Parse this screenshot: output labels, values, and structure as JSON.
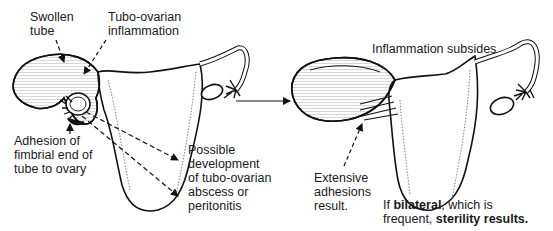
{
  "diagram": {
    "type": "medical-illustration",
    "left_panel": {
      "labels": {
        "swollen_tube": "Swollen\ntube",
        "tubo_ovarian_inflammation": "Tubo-ovarian\ninflammation",
        "adhesion": "Adhesion of\nfimbrial end of\ntube to ovary",
        "possible_development": "Possible\ndevelopment\nof tubo-ovarian\nabscess or\nperitonitis"
      }
    },
    "transition_arrow": "progression-arrow",
    "right_panel": {
      "labels": {
        "inflammation_subsides": "Inflammation subsides",
        "extensive_adhesions": "Extensive\nadhesions\nresult.",
        "bilateral_prefix": "If ",
        "bilateral_bold": "bilateral",
        "bilateral_mid": ", which is",
        "frequent_prefix": "frequent, ",
        "sterility_bold": "sterility results."
      }
    },
    "colors": {
      "line": "#111111",
      "fill": "#ffffff",
      "hatch": "#555555"
    }
  }
}
